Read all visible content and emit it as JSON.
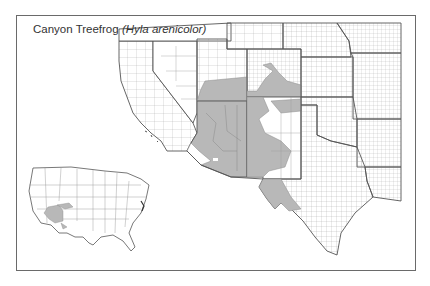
{
  "map": {
    "title": {
      "common_name": "Canyon Treefrog",
      "scientific_name": "(Hyla arenicolor)"
    },
    "colors": {
      "range_fill": "#b8b8b8",
      "county_line": "#8a8a8a",
      "state_line": "#555555",
      "frame": "#6a6a6a",
      "land": "#ffffff"
    },
    "main_map": {
      "region": "Southwestern United States",
      "range_states": [
        "Utah",
        "Colorado",
        "Arizona",
        "New Mexico",
        "Texas"
      ]
    },
    "inset_map": {
      "region": "Contiguous United States",
      "range_states": [
        "Arizona",
        "New Mexico",
        "Utah",
        "Colorado",
        "Texas"
      ]
    }
  }
}
